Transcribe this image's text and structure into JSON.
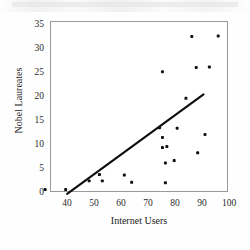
{
  "figure": {
    "background_color": "#ffffff",
    "frame_color": "#9a9a9a",
    "marker_color": "#111111",
    "trend_color": "#0d0d0d"
  },
  "axis": {
    "x_title": "Internet Users",
    "y_title": "Nobel Laureates",
    "x_ticks": [
      "40",
      "50",
      "60",
      "70",
      "80",
      "90",
      "100"
    ],
    "y_ticks": [
      "0",
      "5",
      "10",
      "15",
      "20",
      "25",
      "30",
      "35"
    ]
  },
  "chart_data": {
    "type": "scatter",
    "title": "",
    "xlabel": "Internet Users",
    "ylabel": "Nobel Laureates",
    "xlim": [
      40,
      100
    ],
    "ylim": [
      0,
      35
    ],
    "xticks": [
      40,
      50,
      60,
      70,
      80,
      90,
      100
    ],
    "yticks": [
      0,
      5,
      10,
      15,
      20,
      25,
      30,
      35
    ],
    "grid": false,
    "legend": false,
    "marker": "square-dot",
    "points": [
      {
        "x": 38.0,
        "y": 0.3
      },
      {
        "x": 45.0,
        "y": 0.3
      },
      {
        "x": 53.0,
        "y": 2.1
      },
      {
        "x": 56.5,
        "y": 3.4
      },
      {
        "x": 57.5,
        "y": 2.1
      },
      {
        "x": 65.0,
        "y": 3.3
      },
      {
        "x": 67.5,
        "y": 1.8
      },
      {
        "x": 77.0,
        "y": 13.1
      },
      {
        "x": 78.0,
        "y": 24.7
      },
      {
        "x": 78.0,
        "y": 11.1
      },
      {
        "x": 78.0,
        "y": 9.0
      },
      {
        "x": 79.5,
        "y": 9.2
      },
      {
        "x": 79.0,
        "y": 5.8
      },
      {
        "x": 79.0,
        "y": 1.7
      },
      {
        "x": 82.0,
        "y": 6.3
      },
      {
        "x": 83.0,
        "y": 13.0
      },
      {
        "x": 86.0,
        "y": 19.2
      },
      {
        "x": 88.0,
        "y": 32.0
      },
      {
        "x": 89.5,
        "y": 25.6
      },
      {
        "x": 90.0,
        "y": 7.9
      },
      {
        "x": 92.5,
        "y": 11.7
      },
      {
        "x": 94.0,
        "y": 25.7
      },
      {
        "x": 97.0,
        "y": 32.1
      }
    ],
    "trendline": {
      "type": "linear-fit",
      "x_start": 45.5,
      "y_start": -0.6,
      "x_end": 92.0,
      "y_end": 20.0
    }
  }
}
